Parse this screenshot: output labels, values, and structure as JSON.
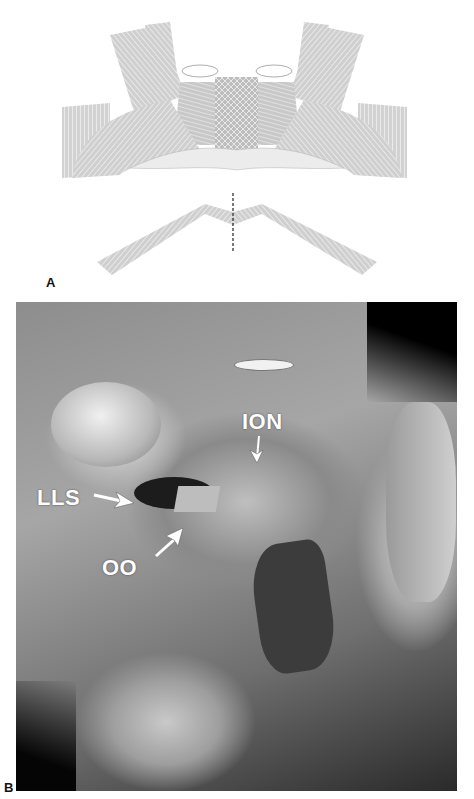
{
  "figure": {
    "panel_a": {
      "label": "A",
      "description": "Illustration of perioral/orbicularis oris muscle fiber arrangement with a dashed vertical midline cut"
    },
    "panel_b": {
      "label": "B",
      "description": "Cadaveric facial dissection photograph",
      "annotations": [
        {
          "text": "ION",
          "arrow": "down"
        },
        {
          "text": "LLS",
          "arrow": "right"
        },
        {
          "text": "OO",
          "arrow": "up-right"
        }
      ]
    }
  }
}
